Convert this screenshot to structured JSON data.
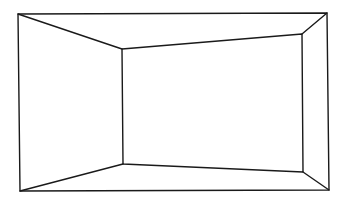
{
  "diagram": {
    "type": "perspective-room-line-drawing",
    "stroke_color": "#1a1a1a",
    "background": "#ffffff",
    "outer_frame": {
      "top_left": [
        18,
        14
      ],
      "top_right": [
        327,
        13
      ],
      "bottom_right": [
        329,
        190
      ],
      "bottom_left": [
        20,
        191
      ]
    },
    "inner_back_wall": {
      "top_left": [
        122,
        49
      ],
      "top_right": [
        302,
        34
      ],
      "bottom_right": [
        303,
        172
      ],
      "bottom_left": [
        123,
        164
      ]
    },
    "surfaces": [
      "ceiling",
      "floor",
      "left-wall",
      "right-wall",
      "back-wall"
    ]
  }
}
